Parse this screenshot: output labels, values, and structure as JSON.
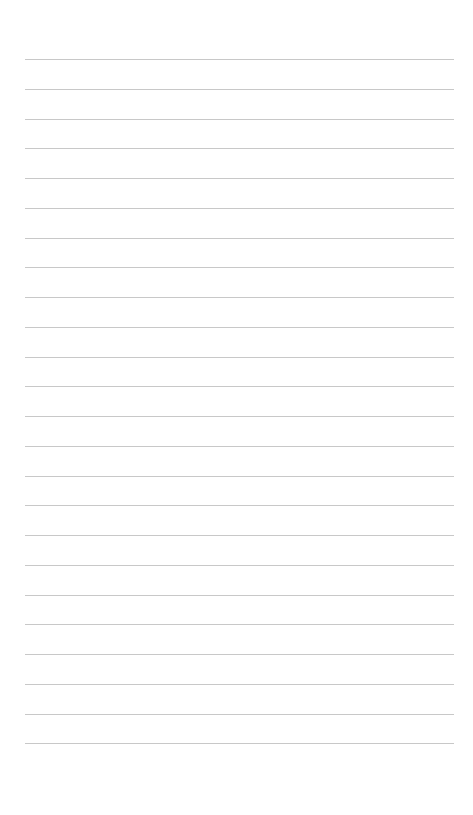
{
  "page": {
    "type": "lined-paper",
    "background_color": "#ffffff",
    "rule_color": "#c8c8c8",
    "rule_count": 24,
    "first_rule_y": 59,
    "rule_spacing": 29.75,
    "rule_left": 25,
    "rule_right": 454
  }
}
